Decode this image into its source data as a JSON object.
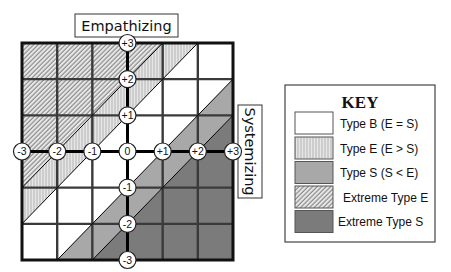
{
  "axes": {
    "vertical_label": "Empathizing",
    "horizontal_label": "Systemizing",
    "vertical_ticks": [
      "+3",
      "+2",
      "+1",
      "0",
      "-1",
      "-2",
      "-3"
    ],
    "horizontal_ticks": [
      "-3",
      "-2",
      "-1",
      "0",
      "+1",
      "+2",
      "+3"
    ]
  },
  "key": {
    "title": "KEY",
    "items": [
      {
        "id": "B",
        "label": "Type B (E = S)",
        "swatch": "solid",
        "color": "#ffffff"
      },
      {
        "id": "E",
        "label": "Type E (E > S)",
        "swatch": "vertical-lines",
        "color": "#e2e2e2"
      },
      {
        "id": "S",
        "label": "Type S (S < E)",
        "swatch": "solid",
        "color": "#a8a8a8"
      },
      {
        "id": "XE",
        "label": "Extreme Type E",
        "swatch": "diagonal-hatch",
        "color": "#e4e4e4"
      },
      {
        "id": "XS",
        "label": "Extreme Type S",
        "swatch": "solid",
        "color": "#7b7b7b"
      }
    ]
  },
  "grid": {
    "rows": 6,
    "cols": 6,
    "cells": [
      [
        "XE",
        "XE",
        "XE",
        {
          "ul": "XE",
          "lr": "E"
        },
        {
          "ul": "E",
          "lr": "B"
        },
        "B"
      ],
      [
        "XE",
        "XE",
        {
          "ul": "XE",
          "lr": "E"
        },
        {
          "ul": "E",
          "lr": "B"
        },
        "B",
        {
          "ul": "B",
          "lr": "S"
        }
      ],
      [
        "XE",
        {
          "ul": "XE",
          "lr": "E"
        },
        {
          "ul": "E",
          "lr": "B"
        },
        "B",
        {
          "ul": "B",
          "lr": "S"
        },
        {
          "ul": "S",
          "lr": "XS"
        }
      ],
      [
        {
          "ul": "XE",
          "lr": "E"
        },
        {
          "ul": "E",
          "lr": "B"
        },
        "B",
        {
          "ul": "B",
          "lr": "S"
        },
        {
          "ul": "S",
          "lr": "XS"
        },
        "XS"
      ],
      [
        {
          "ul": "E",
          "lr": "B"
        },
        "B",
        {
          "ul": "B",
          "lr": "S"
        },
        {
          "ul": "S",
          "lr": "XS"
        },
        "XS",
        "XS"
      ],
      [
        "B",
        {
          "ul": "B",
          "lr": "S"
        },
        {
          "ul": "S",
          "lr": "XS"
        },
        "XS",
        "XS",
        "XS"
      ]
    ]
  }
}
